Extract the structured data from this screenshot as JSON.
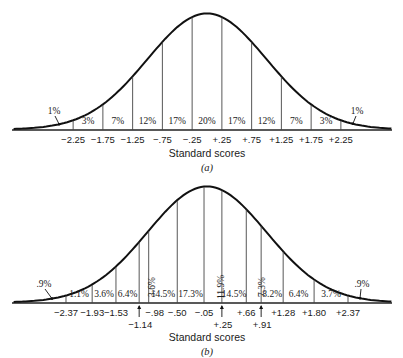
{
  "chart_data": [
    {
      "type": "area",
      "title": "",
      "caption": "(a)",
      "xlabel": "Standard scores",
      "ylabel": "",
      "grid": false,
      "legend": null,
      "boundaries": [
        -2.25,
        -1.75,
        -1.25,
        -0.75,
        -0.25,
        0.25,
        0.75,
        1.25,
        1.75,
        2.25
      ],
      "tick_labels": [
        "−2.25",
        "−1.75",
        "−1.25",
        "−.75",
        "−.25",
        "+.25",
        "+.75",
        "+1.25",
        "+1.75",
        "+2.25"
      ],
      "categories": [
        "< -2.25",
        "-2.25 to -1.75",
        "-1.75 to -1.25",
        "-1.25 to -.75",
        "-.75 to -.25",
        "-.25 to +.25",
        "+.25 to +.75",
        "+.75 to +1.25",
        "+1.25 to +1.75",
        "+1.75 to +2.25",
        "> +2.25"
      ],
      "values": [
        1,
        3,
        7,
        12,
        17,
        20,
        17,
        12,
        7,
        3,
        1
      ],
      "value_labels": [
        "1%",
        "3%",
        "7%",
        "12%",
        "17%",
        "20%",
        "17%",
        "12%",
        "7%",
        "3%",
        "1%"
      ]
    },
    {
      "type": "area",
      "title": "",
      "caption": "(b)",
      "xlabel": "Standard scores",
      "ylabel": "",
      "grid": false,
      "legend": null,
      "boundaries": [
        -2.37,
        -1.93,
        -1.53,
        -1.14,
        -0.98,
        -0.5,
        -0.05,
        0.25,
        0.66,
        0.91,
        1.28,
        1.8,
        2.37
      ],
      "tick_labels": [
        "−2.37",
        "−1.93",
        "−1.53",
        "−1.14",
        "−.98",
        "−.50",
        "−.05",
        "+.25",
        "+.66",
        "+.91",
        "+1.28",
        "+1.80",
        "+2.37"
      ],
      "categories": [
        "< -2.37",
        "-2.37 to -1.93",
        "-1.93 to -1.53",
        "-1.53 to -1.14",
        "-1.14 to -.98",
        "-.98 to -.50",
        "-.50 to -.05",
        "-.05 to +.25",
        "+.25 to +.66",
        "+.66 to +.91",
        "+.91 to +1.28",
        "+1.28 to +1.80",
        "+1.80 to +2.37",
        "> +2.37"
      ],
      "values": [
        0.9,
        1.1,
        3.6,
        6.4,
        3.6,
        14.5,
        17.3,
        11.9,
        14.5,
        7.3,
        8.2,
        6.4,
        3.7,
        0.9
      ],
      "value_labels": [
        ".9%",
        "1.1%",
        "3.6%",
        "6.4%",
        "3.6%",
        "14.5%",
        "17.3%",
        "11.9%",
        "14.5%",
        "7.3%",
        "8.2%",
        "6.4%",
        "3.7%",
        ".9%"
      ]
    }
  ],
  "figure": {
    "a": {
      "xlabel": "Standard scores",
      "caption": "(a)"
    },
    "b": {
      "xlabel": "Standard scores",
      "caption": "(b)"
    }
  }
}
